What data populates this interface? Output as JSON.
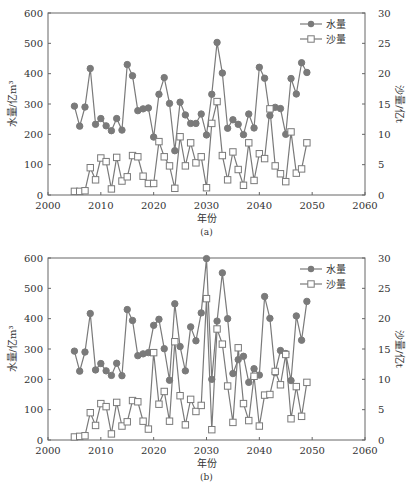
{
  "chart_data": [
    {
      "type": "line",
      "caption": "(a)",
      "title": "",
      "xlabel": "年份",
      "ylabel": "水量/亿m³",
      "y2label": "沙量/亿t",
      "xlim": [
        2000,
        2060
      ],
      "ylim": [
        0,
        600
      ],
      "y2lim": [
        0,
        30
      ],
      "xticks": [
        "2000",
        "2010",
        "2020",
        "2030",
        "2040",
        "2050",
        "2060"
      ],
      "yticks": [
        "0",
        "100",
        "200",
        "300",
        "400",
        "500",
        "600"
      ],
      "y2ticks": [
        "0",
        "5",
        "10",
        "15",
        "20",
        "25",
        "30"
      ],
      "grid": false,
      "legend_position": "upper right",
      "x": [
        2005,
        2006,
        2007,
        2008,
        2009,
        2010,
        2011,
        2012,
        2013,
        2014,
        2015,
        2016,
        2017,
        2018,
        2019,
        2020,
        2021,
        2022,
        2023,
        2024,
        2025,
        2026,
        2027,
        2028,
        2029,
        2030,
        2031,
        2032,
        2033,
        2034,
        2035,
        2036,
        2037,
        2038,
        2039,
        2040,
        2041,
        2042,
        2043,
        2044,
        2045,
        2046,
        2047,
        2048,
        2049
      ],
      "series": [
        {
          "name": "水量",
          "axis": "left",
          "marker": "filled-circle",
          "values": [
            293,
            227,
            290,
            417,
            233,
            252,
            228,
            212,
            252,
            214,
            430,
            393,
            278,
            284,
            287,
            191,
            332,
            387,
            302,
            146,
            306,
            264,
            236,
            236,
            267,
            198,
            332,
            503,
            402,
            220,
            248,
            233,
            199,
            267,
            221,
            421,
            385,
            262,
            289,
            285,
            200,
            384,
            333,
            436,
            404
          ]
        },
        {
          "name": "沙量",
          "axis": "right",
          "marker": "open-square",
          "values": [
            0.6,
            0.6,
            0.7,
            4.5,
            2.5,
            6.1,
            5.5,
            1.0,
            6.2,
            2.3,
            3.0,
            6.5,
            6.3,
            3.1,
            1.9,
            1.9,
            8.8,
            6.3,
            4.8,
            1.1,
            9.6,
            4.8,
            8.6,
            5.3,
            6.3,
            1.2,
            11.8,
            15.4,
            6.5,
            2.5,
            7.1,
            4.2,
            1.6,
            8.6,
            2.4,
            6.8,
            6.0,
            14.2,
            4.8,
            3.5,
            2.2,
            10.4,
            3.6,
            4.3,
            8.6
          ]
        }
      ]
    },
    {
      "type": "line",
      "caption": "(b)",
      "title": "",
      "xlabel": "年份",
      "ylabel": "水量/亿m³",
      "y2label": "沙量/亿t",
      "xlim": [
        2000,
        2060
      ],
      "ylim": [
        0,
        600
      ],
      "y2lim": [
        0,
        30
      ],
      "xticks": [
        "2000",
        "2010",
        "2020",
        "2030",
        "2040",
        "2050",
        "2060"
      ],
      "yticks": [
        "0",
        "100",
        "200",
        "300",
        "400",
        "500",
        "600"
      ],
      "y2ticks": [
        "0",
        "5",
        "10",
        "15",
        "20",
        "25",
        "30"
      ],
      "grid": false,
      "legend_position": "upper right",
      "x": [
        2005,
        2006,
        2007,
        2008,
        2009,
        2010,
        2011,
        2012,
        2013,
        2014,
        2015,
        2016,
        2017,
        2018,
        2019,
        2020,
        2021,
        2022,
        2023,
        2024,
        2025,
        2026,
        2027,
        2028,
        2029,
        2030,
        2031,
        2032,
        2033,
        2034,
        2035,
        2036,
        2037,
        2038,
        2039,
        2040,
        2041,
        2042,
        2043,
        2044,
        2045,
        2046,
        2047,
        2048,
        2049
      ],
      "series": [
        {
          "name": "水量",
          "axis": "left",
          "marker": "filled-circle",
          "values": [
            293,
            227,
            290,
            417,
            231,
            252,
            228,
            213,
            253,
            212,
            430,
            394,
            278,
            284,
            288,
            378,
            398,
            301,
            197,
            449,
            308,
            228,
            373,
            327,
            419,
            598,
            200,
            392,
            551,
            400,
            219,
            265,
            276,
            190,
            235,
            214,
            473,
            401,
            222,
            295,
            285,
            196,
            409,
            329,
            457
          ]
        },
        {
          "name": "沙量",
          "axis": "right",
          "marker": "open-square",
          "values": [
            0.5,
            0.6,
            0.7,
            4.5,
            2.4,
            6.0,
            5.5,
            1.0,
            6.2,
            2.3,
            3.0,
            6.5,
            6.3,
            3.1,
            1.8,
            14.4,
            5.9,
            8.0,
            3.1,
            16.2,
            7.3,
            2.5,
            6.7,
            4.7,
            5.7,
            23.3,
            1.7,
            18.3,
            15.8,
            8.9,
            2.9,
            15.2,
            6.0,
            3.2,
            10.5,
            2.3,
            7.4,
            7.5,
            11.3,
            9.1,
            14.1,
            3.5,
            8.8,
            3.9,
            9.5
          ]
        }
      ]
    }
  ]
}
